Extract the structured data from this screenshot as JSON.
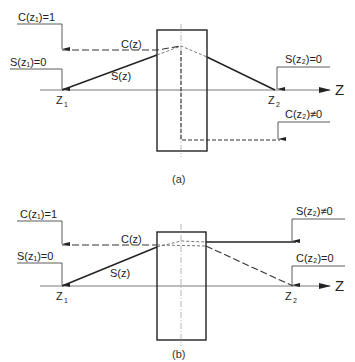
{
  "colors": {
    "ink": "#222222",
    "thin": "#555555",
    "background": "#ffffff"
  },
  "axis_label": "Z",
  "panels": [
    {
      "caption": "(a)",
      "labels": {
        "c_z1": "C(z₁)=1",
        "s_z1": "S(z₁)=0",
        "c_z": "C(z)",
        "s_z": "S(z)",
        "z1": "Z",
        "z1_sub": "1",
        "z2": "Z",
        "z2_sub": "2",
        "s_z2": "S(z₂)=0",
        "c_z2": "C(z₂)≠0"
      }
    },
    {
      "caption": "(b)",
      "labels": {
        "c_z1": "C(z₁)=1",
        "s_z1": "S(z₁)=0",
        "c_z": "C(z)",
        "s_z": "S(z)",
        "z1": "Z",
        "z1_sub": "1",
        "z2": "Z",
        "z2_sub": "2",
        "s_z2": "S(z₂)≠0",
        "c_z2": "C(z₂)=0"
      }
    }
  ]
}
